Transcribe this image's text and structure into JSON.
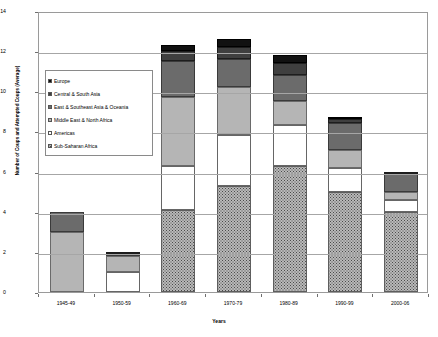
{
  "chart_data": {
    "type": "bar",
    "stacked": true,
    "title": "",
    "xlabel": "Years",
    "ylabel": "Number of Coups and Attempted Coups (Average)",
    "ylim": [
      0,
      14
    ],
    "ytick_step": 2,
    "yticks": [
      0,
      2,
      4,
      6,
      8,
      10,
      12,
      14
    ],
    "grid": true,
    "legend_position": "inside-upper-left",
    "categories": [
      "1945-49",
      "1950-59",
      "1960-69",
      "1970-79",
      "1980-89",
      "1990-99",
      "2000-06"
    ],
    "series": [
      {
        "name": "Sub-Saharan Africa",
        "values": [
          0,
          0,
          4.1,
          5.3,
          6.3,
          5.0,
          4.0
        ]
      },
      {
        "name": "Americas",
        "values": [
          0,
          1.0,
          2.2,
          2.5,
          2.0,
          1.2,
          0.6
        ]
      },
      {
        "name": "Middle East & North Africa",
        "values": [
          3.0,
          0.8,
          3.4,
          2.4,
          1.2,
          0.9,
          0.4
        ]
      },
      {
        "name": "East & Southeast Asia & Oceania",
        "values": [
          1.0,
          0.1,
          1.8,
          1.4,
          1.3,
          1.3,
          0.9
        ]
      },
      {
        "name": "Central & South Asia",
        "values": [
          0,
          0.1,
          0.5,
          0.6,
          0.6,
          0.2,
          0.1
        ]
      },
      {
        "name": "Europe",
        "values": [
          0,
          0,
          0.3,
          0.4,
          0.4,
          0.1,
          0
        ]
      }
    ],
    "totals": [
      4.0,
      2.0,
      12.3,
      12.6,
      11.8,
      8.7,
      6.0
    ]
  },
  "legend": {
    "items": [
      {
        "label": "Europe",
        "swatch": "black-square-swatch"
      },
      {
        "label": "Central & South Asia",
        "swatch": "dark-gray-square-swatch"
      },
      {
        "label": "East & Southeast Asia & Oceania",
        "swatch": "medium-gray-square-swatch"
      },
      {
        "label": "Middle East & North Africa",
        "swatch": "light-gray-square-swatch"
      },
      {
        "label": "Americas",
        "swatch": "white-square-swatch"
      },
      {
        "label": "Sub-Saharan Africa",
        "swatch": "speckled-square-swatch"
      }
    ]
  },
  "colors": {
    "europe": "#111111",
    "central_south_asia": "#3f3f3f",
    "east_southeast_asia": "#6b6b6b",
    "middle_east_north_africa": "#b5b5b5",
    "americas": "#ffffff",
    "sub_saharan_africa": "#b9b9b9",
    "grid": "#a6a6a6",
    "axis": "#9a9a9a"
  }
}
